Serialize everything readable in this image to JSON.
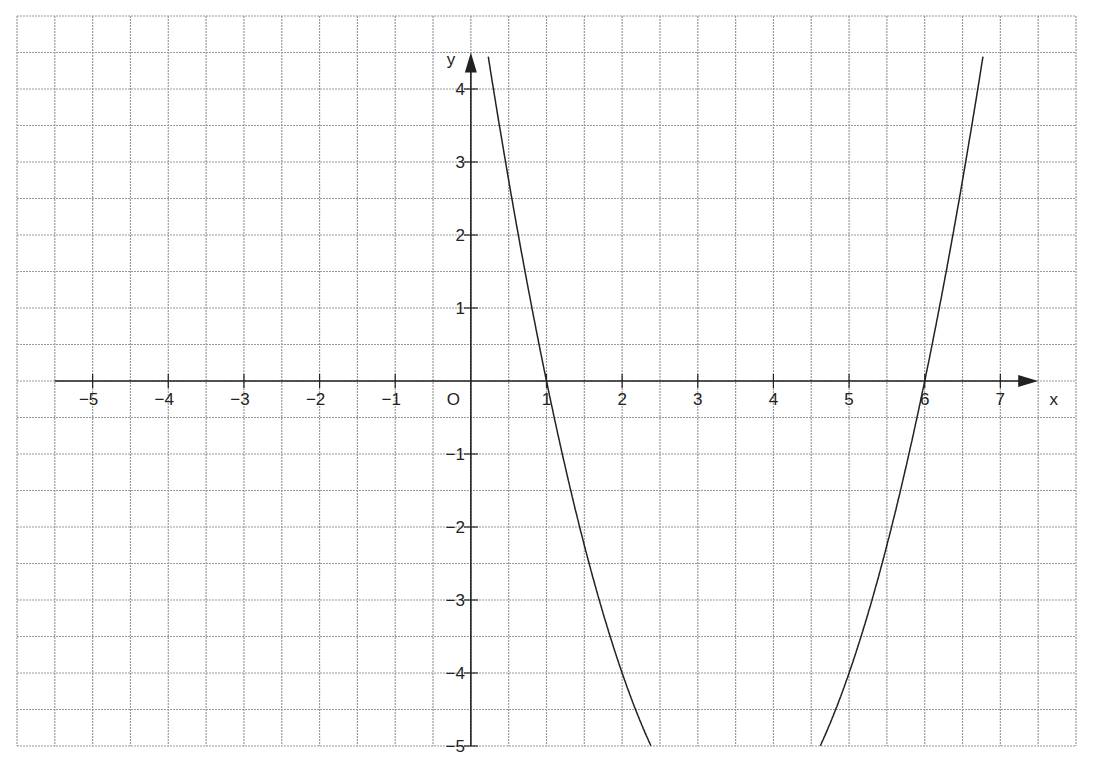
{
  "chart_data": {
    "type": "line",
    "title": "",
    "xlabel": "x",
    "ylabel": "y",
    "origin_label": "O",
    "xlim": [
      -6,
      8
    ],
    "ylim": [
      -5,
      5
    ],
    "grid": true,
    "grid_step": 0.5,
    "x_ticks": [
      -5,
      -4,
      -3,
      -2,
      -1,
      1,
      2,
      3,
      4,
      5,
      6,
      7
    ],
    "x_tick_labels": [
      "−5",
      "−4",
      "−3",
      "−2",
      "−1",
      "1",
      "2",
      "3",
      "4",
      "5",
      "6",
      "7"
    ],
    "y_ticks": [
      4,
      3,
      2,
      1,
      -1,
      -2,
      -3,
      -4,
      -5
    ],
    "y_tick_labels": [
      "4",
      "3",
      "2",
      "1",
      "−1",
      "−2",
      "−3",
      "−4",
      "−5"
    ],
    "series": [
      {
        "name": "y = x² − 7x + 6",
        "coefficients": {
          "a": 1,
          "b": -7,
          "c": 6
        },
        "roots": [
          1,
          6
        ],
        "x_range": [
          0.22,
          6.78
        ],
        "y_clip": [
          -5,
          4.5
        ],
        "points": [
          {
            "x": 0.22,
            "y": 4.5
          },
          {
            "x": 0.5,
            "y": 2.75
          },
          {
            "x": 1,
            "y": 0
          },
          {
            "x": 1.5,
            "y": -2.25
          },
          {
            "x": 2,
            "y": -4
          },
          {
            "x": 2.38,
            "y": -5
          },
          {
            "x": 4.62,
            "y": -5
          },
          {
            "x": 5,
            "y": -4
          },
          {
            "x": 5.5,
            "y": -2.25
          },
          {
            "x": 6,
            "y": 0
          },
          {
            "x": 6.5,
            "y": 2.75
          },
          {
            "x": 6.78,
            "y": 4.5
          }
        ]
      }
    ]
  },
  "colors": {
    "grid": "#9a9a9a",
    "axis": "#222222",
    "curve": "#222222",
    "background": "#ffffff"
  }
}
